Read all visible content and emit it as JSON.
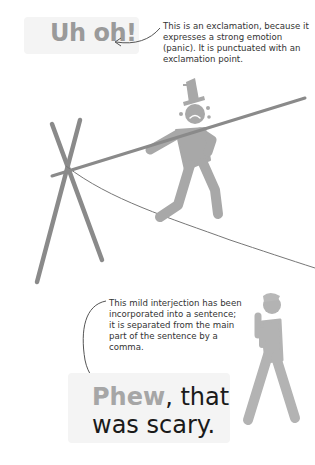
{
  "illustration_1": {
    "exclamation": "Uh oh!",
    "note": "This is an exclamation, because it expresses a strong emotion (panic). It is punctuated with an exclamation point.",
    "scene": "tightrope-walker-with-top-hat-crying"
  },
  "illustration_2": {
    "interjection": "Phew",
    "sentence_rest_line1": ", that",
    "sentence_rest_line2": "was scary.",
    "note": "This mild interjection has been incorporated into a sentence; it is separated from the main part of the sentence by a comma.",
    "scene": "relieved-figure-hands-together"
  },
  "colors": {
    "figure_gray": "#a8a8a8",
    "pole_gray": "#8a8a8a",
    "highlight_text": "#9a9a9a",
    "box_bg": "#f4f4f4",
    "body_text": "#333333"
  }
}
